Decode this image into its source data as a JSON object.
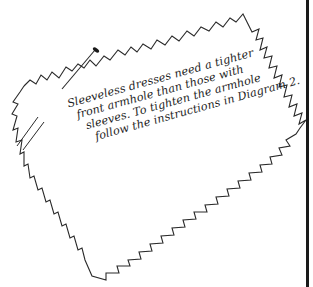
{
  "figure": {
    "type": "sewing-instruction-illustration",
    "caption_lines": [
      "Sleeveless dresses need a tighter",
      "front armhole than those with",
      "sleeves. To tighten the armhole",
      "follow the instructions in Diagram 2."
    ],
    "elements": {
      "swatch": "pinked-edge fabric swatch",
      "pin": "straight pin",
      "notch_marks": "double slash notch marks",
      "page_border": "right margin rule"
    },
    "colors": {
      "ink": "#1e1e1e",
      "background": "#ffffff"
    }
  }
}
